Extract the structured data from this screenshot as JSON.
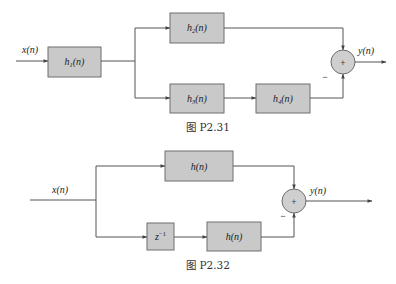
{
  "colors": {
    "block_fill": "#c9c9c9",
    "block_stroke": "#6e6e6e",
    "line": "#555555",
    "text": "#222222",
    "background": "#ffffff"
  },
  "figure1": {
    "caption": "图 P2.31",
    "input_label": "x(n)",
    "output_label": "y(n)",
    "blocks": [
      {
        "id": "h1",
        "base": "h",
        "sub": "1",
        "arg": "(n)"
      },
      {
        "id": "h2",
        "base": "h",
        "sub": "2",
        "arg": "(n)"
      },
      {
        "id": "h3",
        "base": "h",
        "sub": "3",
        "arg": "(n)"
      },
      {
        "id": "h4",
        "base": "h",
        "sub": "4",
        "arg": "(n)"
      }
    ],
    "summer": {
      "symbol": "+",
      "minus_sign": "−"
    }
  },
  "figure2": {
    "caption": "图 P2.32",
    "input_label": "x(n)",
    "output_label": "y(n)",
    "blocks": [
      {
        "id": "h_top",
        "label": "h(n)"
      },
      {
        "id": "delay",
        "base": "z",
        "sup": "−1"
      },
      {
        "id": "h_bottom",
        "label": "h(n)"
      }
    ],
    "summer": {
      "symbol": "+",
      "minus_sign": "−"
    }
  }
}
